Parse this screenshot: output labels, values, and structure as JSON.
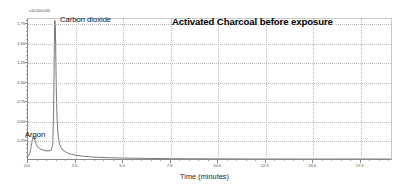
{
  "chart_data": {
    "type": "line",
    "title": "Activated Charcoal before exposure",
    "xlabel": "Time (minutes)",
    "ylabel": "",
    "y_offset_text": "x10,000,000",
    "xlim": [
      0.0,
      19.2
    ],
    "ylim": [
      0.0,
      1.82
    ],
    "grid": true,
    "legend": "none",
    "x_ticks": [
      0.0,
      2.5,
      5.0,
      7.5,
      10.0,
      12.5,
      15.0,
      17.5
    ],
    "x_tick_labels": [
      "0.0",
      "2.5",
      "5.0",
      "7.5",
      "10.0",
      "12.5",
      "15.0",
      "17.5"
    ],
    "y_ticks": [
      0.25,
      0.5,
      0.75,
      1.0,
      1.25,
      1.5,
      1.75
    ],
    "y_tick_labels": [
      "0.25",
      "0.50",
      "0.75",
      "1.00",
      "1.25",
      "1.50",
      "1.75"
    ],
    "annotations": [
      {
        "text": "Carbon dioxide",
        "x": 2.3,
        "y": 1.78
      },
      {
        "text": "Argon",
        "x": 0.05,
        "y": 0.36
      },
      {
        "text": "Activated Charcoal before exposure",
        "x": 8.0,
        "y": 1.76
      }
    ],
    "series": [
      {
        "name": "TCD signal",
        "color": "#555555",
        "x": [
          0.0,
          0.1,
          0.18,
          0.24,
          0.28,
          0.32,
          0.38,
          0.46,
          0.56,
          0.68,
          0.8,
          0.95,
          1.1,
          1.22,
          1.3,
          1.34,
          1.37,
          1.39,
          1.4,
          1.42,
          1.44,
          1.46,
          1.48,
          1.5,
          1.53,
          1.56,
          1.6,
          1.66,
          1.74,
          1.84,
          1.96,
          2.1,
          2.3,
          2.55,
          2.85,
          3.2,
          3.6,
          4.1,
          4.7,
          5.4,
          6.2,
          7.1,
          8.1,
          9.2,
          10.4,
          11.6,
          12.8,
          14.0,
          15.2,
          16.4,
          17.4,
          18.2,
          18.8,
          19.2
        ],
        "y": [
          0.06,
          0.1,
          0.2,
          0.29,
          0.32,
          0.3,
          0.25,
          0.2,
          0.17,
          0.15,
          0.14,
          0.13,
          0.13,
          0.14,
          0.2,
          0.55,
          1.1,
          1.55,
          1.78,
          1.8,
          1.72,
          1.4,
          1.05,
          0.78,
          0.55,
          0.4,
          0.3,
          0.22,
          0.17,
          0.14,
          0.12,
          0.1,
          0.085,
          0.072,
          0.062,
          0.054,
          0.048,
          0.043,
          0.039,
          0.036,
          0.033,
          0.031,
          0.029,
          0.028,
          0.027,
          0.026,
          0.026,
          0.025,
          0.025,
          0.025,
          0.026,
          0.026,
          0.025,
          0.025
        ]
      }
    ]
  },
  "colors": {
    "trace": "#555555",
    "axis": "#8a8a8a",
    "grid": "#b9b9b9",
    "text": "#1a1a1a",
    "background": "#ffffff"
  }
}
